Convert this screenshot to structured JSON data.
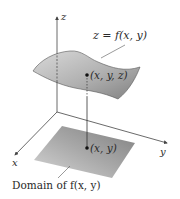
{
  "diagram": {
    "axes": {
      "z_label": "z",
      "x_label": "x",
      "y_label": "y"
    },
    "surface": {
      "label": "z = f(x, y)",
      "color_light": "#d8d8d8",
      "color_dark": "#8a8a8a"
    },
    "point_on_surface": {
      "label": "(x, y, z)"
    },
    "point_in_domain": {
      "label": "(x, y)"
    },
    "domain": {
      "label": "Domain of f(x, y)",
      "color_light": "#c8c8c8",
      "color_dark": "#8f8f8f"
    },
    "colors": {
      "axis": "#444444",
      "text": "#2a2a2a",
      "point": "#111111"
    }
  }
}
